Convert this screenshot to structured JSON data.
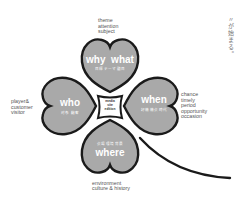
{
  "colors": {
    "leaf_fill": "#a9a9a9",
    "outline": "#1a1a1a",
    "label_text": "#555555",
    "background": "#ffffff"
  },
  "leaves": {
    "top": {
      "title": "why  what",
      "subtitle": "目標 テーマ 題目",
      "annotation": "theme\nattention\nsubject"
    },
    "left": {
      "title": "who",
      "subtitle": "対象 顧客",
      "annotation": "player&\ncustomer\nvisitor"
    },
    "right": {
      "title": "when",
      "subtitle": "好機 機会 時代",
      "annotation": "chance\ntimely\nperiod\nopportunity\noccasion"
    },
    "bottom": {
      "title": "where",
      "subtitle": "会場 環境 背景",
      "annotation": "environment\nculture & history"
    }
  },
  "center": {
    "line1": "media",
    "line2": "site",
    "line3": "edition"
  },
  "vertical_text": "〃が始まる。"
}
